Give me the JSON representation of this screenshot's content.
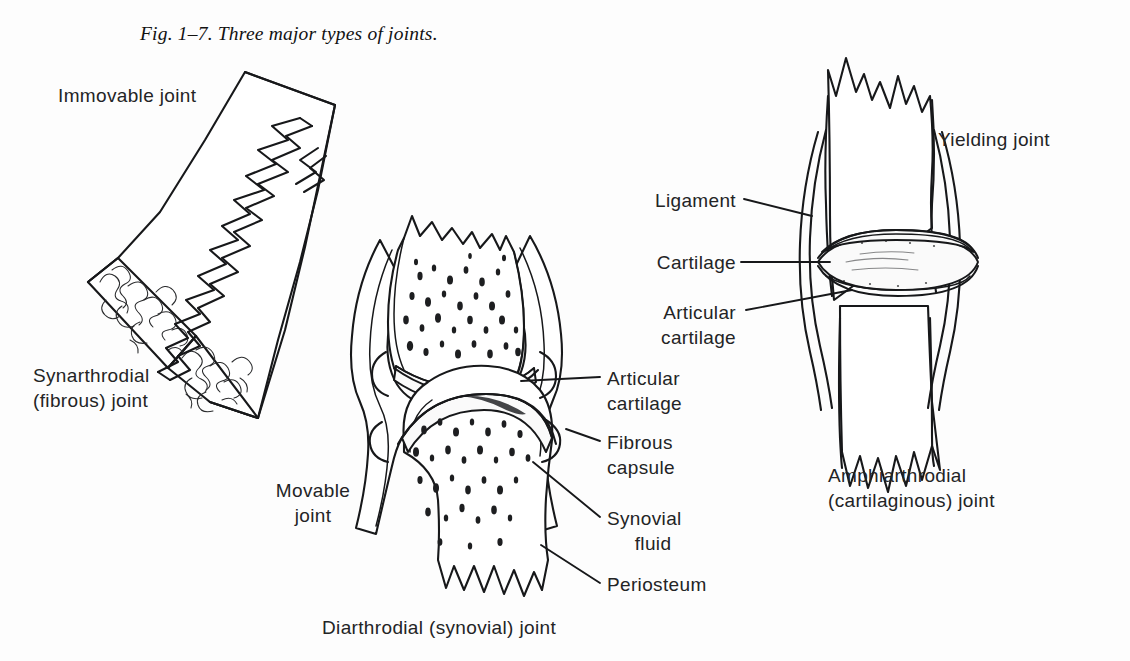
{
  "figure": {
    "caption": "Fig. 1–7. Three major types of joints."
  },
  "panels": {
    "left": {
      "type_label": "Immovable joint",
      "name_line1": "Synarthrodial",
      "name_line2": "(fibrous) joint",
      "features": [
        "suture",
        "cancellous bone"
      ]
    },
    "middle": {
      "type_line1": "Movable",
      "type_line2": "joint",
      "name": "Diarthrodial (synovial) joint",
      "labels": [
        {
          "line1": "Articular",
          "line2": "cartilage"
        },
        {
          "line1": "Fibrous",
          "line2": "capsule"
        },
        {
          "line1": "Synovial",
          "line2": "fluid"
        },
        {
          "line1": "Periosteum",
          "line2": ""
        }
      ]
    },
    "right": {
      "type_label": "Yielding joint",
      "name_line1": "Amphiarthrodial",
      "name_line2": "(cartilaginous) joint",
      "labels": [
        {
          "line1": "Ligament",
          "line2": ""
        },
        {
          "line1": "Cartilage",
          "line2": ""
        },
        {
          "line1": "Articular",
          "line2": "cartilage"
        }
      ]
    }
  },
  "style": {
    "ink": "#17181a",
    "paper": "#fdfdfd"
  }
}
